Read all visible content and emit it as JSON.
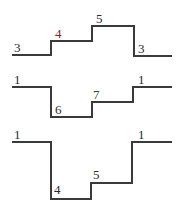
{
  "diagrams": [
    {
      "name": "staircase-1",
      "labels": [
        "3",
        "4",
        "5",
        "3"
      ],
      "label_colors": [
        "#2a2a2a",
        "#7a2a2a",
        "#2a2a2a",
        "#2a2a2a"
      ]
    },
    {
      "name": "staircase-2",
      "labels": [
        "1",
        "6",
        "7",
        "1"
      ],
      "label_colors": [
        "#2a2a2a",
        "#2a2a2a",
        "#2a4a3a",
        "#2a2a2a"
      ]
    },
    {
      "name": "staircase-3",
      "labels": [
        "1",
        "4",
        "5",
        "1"
      ],
      "label_colors": [
        "#2a2a2a",
        "#2a2a2a",
        "#2a2a2a",
        "#2a2a2a"
      ]
    }
  ]
}
